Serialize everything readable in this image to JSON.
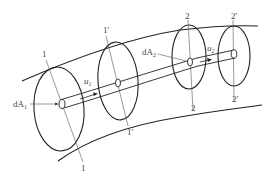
{
  "diagram": {
    "type": "stream-tube",
    "sections": [
      {
        "id": "1",
        "top_label": "1",
        "bottom_label": "1"
      },
      {
        "id": "1p",
        "top_label": "1'",
        "bottom_label": "1'"
      },
      {
        "id": "2",
        "top_label": "2",
        "bottom_label": "2"
      },
      {
        "id": "2p",
        "top_label": "2'",
        "bottom_label": "2'"
      }
    ],
    "labels": {
      "dA1": "dA",
      "dA1_sub": "1",
      "dA2": "dA",
      "dA2_sub": "2",
      "u1": "u",
      "u1_sub": "1",
      "u2": "u",
      "u2_sub": "2"
    },
    "colors": {
      "stroke": "#222222",
      "thin_stroke": "#555555",
      "label": "#444444"
    }
  },
  "caption": {
    "text": "",
    "visible": true,
    "note": "faint caption text, unreadable"
  }
}
